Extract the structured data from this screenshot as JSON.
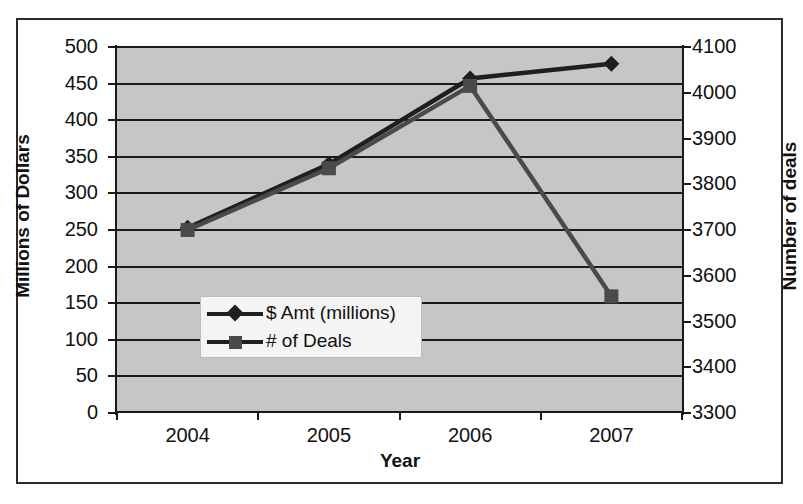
{
  "chart_data": {
    "type": "line",
    "title": "",
    "xlabel": "Year",
    "ylabel": "Millions of Dollars",
    "ylabel_secondary": "Number of deals",
    "categories": [
      "2004",
      "2005",
      "2006",
      "2007"
    ],
    "grid": true,
    "legend_position": "inside-lower-left",
    "plot_background": "#c6c6c6",
    "axes": {
      "left": {
        "label": "Millions of Dollars",
        "min": 0,
        "max": 500,
        "tick_step": 50,
        "ticks": [
          0,
          50,
          100,
          150,
          200,
          250,
          300,
          350,
          400,
          450,
          500
        ],
        "tick_labels": [
          "0",
          "50",
          "100",
          "150",
          "200",
          "250",
          "300",
          "350",
          "400",
          "450",
          "500"
        ]
      },
      "right": {
        "label": "Number of deals",
        "min": 3300,
        "max": 4100,
        "tick_step": 100,
        "ticks": [
          3300,
          3400,
          3500,
          3600,
          3700,
          3800,
          3900,
          4000,
          4100
        ],
        "tick_labels": [
          "3300",
          "3400",
          "3500",
          "3600",
          "3700",
          "3800",
          "3900",
          "4000",
          "4100"
        ]
      },
      "x": {
        "label": "Year",
        "tick_labels": [
          "2004",
          "2005",
          "2006",
          "2007"
        ]
      }
    },
    "series": [
      {
        "name": "$ Amt (millions)",
        "axis": "left",
        "marker": "diamond",
        "color": "#1f1f1f",
        "values": [
          253,
          340,
          457,
          477
        ]
      },
      {
        "name": "# of Deals",
        "axis": "right",
        "marker": "square",
        "color": "#4a4a4a",
        "values": [
          3700,
          3835,
          4015,
          3555
        ]
      }
    ],
    "legend": [
      {
        "label": "$ Amt (millions)",
        "marker": "diamond",
        "color": "#1f1f1f"
      },
      {
        "label": "# of Deals",
        "marker": "square",
        "color": "#4a4a4a"
      }
    ]
  }
}
